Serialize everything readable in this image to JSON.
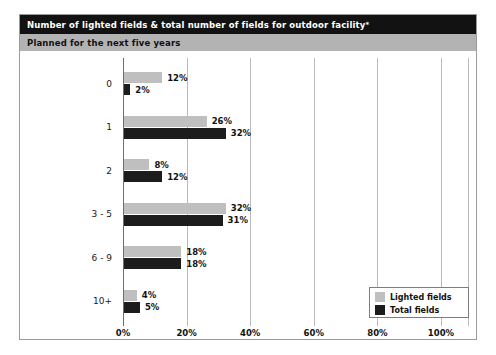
{
  "header": {
    "title": "Number of lighted fields & total number of fields for outdoor facility",
    "title_footnote_marker": "*",
    "subtitle": "Planned for the next five years"
  },
  "legend": {
    "items": [
      {
        "label": "Lighted fields",
        "color": "#bfbfbf",
        "swatch_name": "legend-swatch-lighted-fields"
      },
      {
        "label": "Total fields",
        "color": "#1c1c1c",
        "swatch_name": "legend-swatch-total-fields"
      }
    ]
  },
  "chart_data": {
    "type": "bar",
    "orientation": "horizontal",
    "title": "Number of lighted fields & total number of fields for outdoor facility*",
    "subtitle": "Planned for the next five years",
    "xlabel": "",
    "ylabel": "",
    "categories": [
      "0",
      "1",
      "2",
      "3 - 5",
      "6 - 9",
      "10+"
    ],
    "series": [
      {
        "name": "Lighted fields",
        "color": "#bfbfbf",
        "values": [
          12,
          26,
          8,
          32,
          18,
          4
        ],
        "labels": [
          "12%",
          "26%",
          "8%",
          "32%",
          "18%",
          "4%"
        ]
      },
      {
        "name": "Total fields",
        "color": "#1c1c1c",
        "values": [
          2,
          32,
          12,
          31,
          18,
          5
        ],
        "labels": [
          "2%",
          "32%",
          "12%",
          "31%",
          "18%",
          "5%"
        ]
      }
    ],
    "xlim": [
      0,
      100
    ],
    "xticks": [
      0,
      20,
      40,
      60,
      80,
      100
    ],
    "xtick_labels": [
      "0%",
      "20%",
      "40%",
      "60%",
      "80%",
      "100%"
    ],
    "grid": "vertical",
    "legend_position": "bottom-right",
    "value_unit": "%"
  }
}
